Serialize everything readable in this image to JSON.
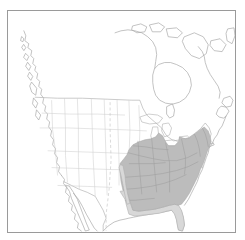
{
  "figure": {
    "kind": "species-range-map",
    "title": "",
    "caption": "",
    "region": "North America",
    "projection": "conic",
    "frame": {
      "visible": true,
      "color": "#9a9a9a",
      "x": 7,
      "y": 10,
      "width": 229,
      "height": 223
    }
  },
  "legend": {
    "visible": false,
    "entries": [
      {
        "key": "range-core",
        "label": "Breeding / resident range",
        "color": "#bcbcbc"
      },
      {
        "key": "range-light",
        "label": "Peripheral range",
        "color": "#d8d8d8"
      }
    ]
  },
  "basemap": {
    "background_color": "#ffffff",
    "coastline_color": "#a8a8a8",
    "international_border_color": "#b4b4b4",
    "state_border_color": "#cfcfcf",
    "lake_fill_color": "#ffffff"
  },
  "range": {
    "core_fill": "#bcbcbc",
    "core_stroke": "#a6a6a6",
    "peripheral_fill": "#d8d8d8",
    "peripheral_stroke": "#b0b0b0",
    "description": "Shaded distribution covering the eastern and southeastern United States, extending from eastern Texas and Louisiana east to the Atlantic coast, south to the Florida peninsula, and north through the Appalachians into New England and the lower Great Lakes."
  },
  "features": {
    "landmasses": [
      "North America mainland",
      "Baja California",
      "Vancouver Island",
      "Queen Charlotte Islands",
      "Newfoundland",
      "Canadian Arctic Archipelago"
    ],
    "water_bodies": [
      "Hudson Bay",
      "Great Lakes",
      "Gulf of Mexico",
      "Atlantic Ocean",
      "Pacific Ocean"
    ],
    "political": [
      "United States",
      "Canada",
      "Mexico"
    ]
  }
}
